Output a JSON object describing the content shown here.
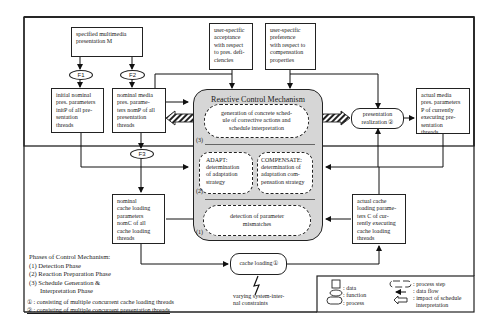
{
  "diagram": {
    "title": "Reactive Control Mechanism",
    "inputs": {
      "specified_presentation": "specified multimedia presentation M",
      "user_acceptance": "user-specific acceptance with respect to pres. deficiencies",
      "user_preference": "user-specific preference with respect to compensation properties"
    },
    "functions": {
      "f1": "F1",
      "f2": "F2",
      "f3": "F3"
    },
    "data": {
      "initial_nominal": "initial nominal pres. parameters initP of all presentation threads",
      "nominal_media": "nominal media pres. parameters nomP of all presentation threads",
      "nominal_cache": "nominal cache loading parameters nomC of all cache loading threads",
      "actual_media": "actual media pres. parameters P of currently executing presentation threads",
      "actual_cache": "actual cache loading parameters C of currently executing cache loading threads"
    },
    "data_lines": {
      "initial_nominal": [
        "initial nominal",
        "pres. parameters",
        "initP of all pre-",
        "sentation",
        "threads"
      ],
      "nominal_media": [
        "nominal media",
        "pres. parame-",
        "ters nomP of all",
        "presentation",
        "threads"
      ],
      "nominal_cache": [
        "nominal",
        "cache loading",
        "parameters",
        "nomC  of all",
        "cache loading",
        "threads"
      ],
      "actual_media": [
        "actual media",
        "pres. parameters",
        "P of currently",
        "executing pre-",
        "sentation",
        "threads"
      ],
      "actual_cache": [
        "actual cache",
        "loading parame-",
        "ters C of cur-",
        "rently executing",
        "cache loading",
        "threads"
      ],
      "user_acceptance": [
        "user-specific",
        "acceptance",
        "with respect",
        "to pres. defi-",
        "ciencies"
      ],
      "user_preference": [
        "user-specific",
        "preference",
        "with respect to",
        "compensation",
        "properties"
      ],
      "specified_presentation": [
        "specified multimedia",
        "presentation M"
      ]
    },
    "process_steps": {
      "generation": "generation of concrete schedule of corrective actions and schedule interpretation",
      "adapt": "ADAPT: determination of adaptation strategy",
      "compensate": "COMPENSATE: determination of adaptation compensation strategy",
      "detection": "detection of parameter mismatches"
    },
    "process_lines": {
      "generation": [
        "generation of concrete sched-",
        "ule of corrective actions and",
        "schedule interpretation"
      ],
      "adapt": [
        "ADAPT:",
        "determination",
        "of adaptation",
        "strategy"
      ],
      "compensate": [
        "COMPENSATE:",
        "determination of",
        "adaptation com-",
        "pensation strategy"
      ],
      "detection": [
        "detection of parameter",
        "mismatches"
      ]
    },
    "processes": {
      "presentation_realization": "presentation realization ②",
      "cache_loading": "cache loading①"
    },
    "constraints": "varying system-internal constraints",
    "constraints_lines": [
      "varying system-inter-",
      "nal constraints"
    ],
    "phase_markers": [
      "(1)",
      "(2)",
      "(3)"
    ],
    "phases": {
      "heading": "Phases of Control Mechanism:",
      "items": [
        "(1) Detection Phase",
        "(2) Reaction Preparation Phase",
        "(3) Schedule Generation &",
        "Interpretation Phase"
      ],
      "note1": "① : consisting of multiple concurrent cache loading threads",
      "note2": "② : consisting of multiple concurrent presentation threads"
    },
    "legend": {
      "data": ": data",
      "function": ": function",
      "process": ": process",
      "process_step": ": process step",
      "data_flow": ": data flow",
      "impact": ": impact of schedule",
      "impact2": "interpretation"
    }
  }
}
